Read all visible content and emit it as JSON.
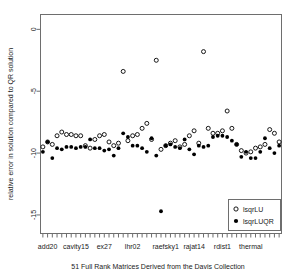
{
  "chart_data": {
    "type": "scatter",
    "title": "",
    "xlabel": "51 Full Rank Matrices Derived from the Davis Collection",
    "ylabel": "relative error in solution compared to QR solution",
    "ylim": [
      -16.5,
      1.2
    ],
    "yticks": [
      0,
      -5,
      -10,
      -15
    ],
    "ytick_labels": [
      "0",
      "-5",
      "-10",
      "-15"
    ],
    "xlim": [
      0.5,
      51.5
    ],
    "grid": false,
    "n_matrices": 51,
    "x_category_labels": [
      "add20",
      "cavity15",
      "ex27",
      "lhr02",
      "raefsky1",
      "rajat14",
      "rdist1",
      "thermal"
    ],
    "x_category_positions": [
      2,
      8,
      14,
      20,
      27,
      33,
      39,
      45
    ],
    "legend": {
      "position": "bottom-right",
      "entries": [
        {
          "name": "lsqrLU",
          "marker": "open-circle"
        },
        {
          "name": "lsqrLUQR",
          "marker": "filled-circle"
        }
      ]
    },
    "series": [
      {
        "name": "lsqrLU",
        "marker": "open-circle",
        "x": [
          1,
          2,
          3,
          4,
          5,
          6,
          7,
          8,
          9,
          10,
          11,
          12,
          13,
          14,
          15,
          16,
          17,
          18,
          19,
          20,
          21,
          22,
          23,
          24,
          25,
          26,
          27,
          28,
          29,
          30,
          31,
          32,
          33,
          34,
          35,
          36,
          37,
          38,
          39,
          40,
          41,
          42,
          43,
          44,
          45,
          46,
          47,
          48,
          49,
          50,
          51
        ],
        "y": [
          -9.5,
          -9.1,
          -9.3,
          -8.6,
          -8.3,
          -8.5,
          -8.5,
          -8.6,
          -8.6,
          -9.4,
          -9.6,
          -8.9,
          -8.6,
          -8.5,
          -9.1,
          -9.4,
          -9.2,
          -3.4,
          -9.0,
          -8.6,
          -8.5,
          -8.0,
          -7.6,
          -8.9,
          -2.5,
          -9.7,
          -9.4,
          -9.2,
          -9.0,
          -9.5,
          -9.3,
          -8.6,
          -8.2,
          -9.2,
          -1.8,
          -8.0,
          -8.4,
          -8.4,
          -8.2,
          -6.6,
          -8.0,
          -9.3,
          -9.8,
          -10.0,
          -9.9,
          -9.6,
          -9.5,
          -9.3,
          -8.1,
          -8.4,
          -9.1
        ]
      },
      {
        "name": "lsqrLUQR",
        "marker": "filled-circle",
        "x": [
          1,
          2,
          3,
          4,
          5,
          6,
          7,
          8,
          9,
          10,
          11,
          12,
          13,
          14,
          15,
          16,
          17,
          18,
          19,
          20,
          21,
          22,
          23,
          24,
          25,
          26,
          27,
          28,
          29,
          30,
          31,
          32,
          33,
          34,
          35,
          36,
          37,
          38,
          39,
          40,
          41,
          42,
          43,
          44,
          45,
          46,
          47,
          48,
          49,
          50,
          51
        ],
        "y": [
          -9.9,
          -9.1,
          -10.4,
          -9.6,
          -9.7,
          -9.5,
          -9.5,
          -9.6,
          -9.5,
          -9.5,
          -8.9,
          -9.6,
          -9.6,
          -9.8,
          -9.7,
          -10.2,
          -9.6,
          -8.4,
          -8.7,
          -9.4,
          -9.4,
          -9.6,
          -9.9,
          -8.8,
          -10.2,
          -14.7,
          -9.4,
          -9.3,
          -9.5,
          -9.6,
          -8.9,
          -9.7,
          -10.1,
          -9.4,
          -9.5,
          -9.4,
          -8.7,
          -8.6,
          -8.6,
          -8.7,
          -9.0,
          -9.3,
          -10.3,
          -9.9,
          -10.4,
          -10.4,
          -9.9,
          -8.8,
          -9.6,
          -10.0,
          -9.4
        ]
      }
    ]
  },
  "ghost_text": ""
}
